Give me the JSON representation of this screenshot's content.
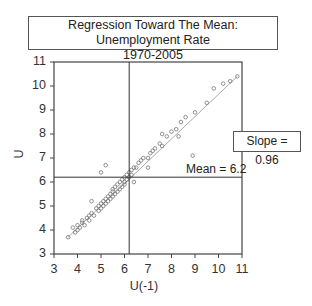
{
  "title": {
    "line1": "Regression Toward The Mean: Unemployment Rate",
    "line2": "1970-2005"
  },
  "annotations": {
    "slope": "Slope = 0.96",
    "mean": "Mean = 6.2"
  },
  "axes": {
    "xlabel": "U(-1)",
    "ylabel": "U",
    "x_ticks": [
      "3",
      "4",
      "5",
      "6",
      "7",
      "8",
      "9",
      "10",
      "11"
    ],
    "y_ticks": [
      "3",
      "4",
      "5",
      "6",
      "7",
      "8",
      "9",
      "10",
      "11"
    ]
  },
  "colors": {
    "frame": "#444444",
    "points": "#777777",
    "regression_line": "#aaaaaa",
    "mean_lines": "#333333"
  },
  "chart_data": {
    "type": "scatter",
    "title": "Regression Toward The Mean: Unemployment Rate 1970-2005",
    "xlabel": "U(-1)",
    "ylabel": "U",
    "xlim": [
      3,
      11
    ],
    "ylim": [
      3,
      11
    ],
    "grid": false,
    "mean": 6.2,
    "slope": 0.96,
    "regression_line": {
      "x": [
        3.6,
        10.8
      ],
      "y": [
        3.7,
        10.4
      ]
    },
    "series": [
      {
        "name": "U vs U(-1)",
        "x": [
          3.6,
          3.8,
          3.9,
          4.0,
          4.0,
          4.1,
          4.2,
          4.2,
          4.3,
          4.4,
          4.5,
          4.5,
          4.6,
          4.7,
          4.8,
          4.9,
          4.9,
          5.0,
          5.0,
          5.1,
          5.1,
          5.2,
          5.2,
          5.3,
          5.3,
          5.4,
          5.4,
          5.5,
          5.5,
          5.5,
          5.6,
          5.6,
          5.7,
          5.7,
          5.8,
          5.8,
          5.9,
          5.9,
          6.0,
          6.0,
          6.0,
          6.1,
          6.1,
          6.2,
          6.2,
          6.3,
          6.3,
          6.4,
          6.5,
          6.6,
          6.7,
          6.8,
          7.0,
          7.1,
          7.2,
          7.3,
          7.5,
          7.6,
          7.8,
          8.0,
          8.2,
          8.4,
          8.6,
          9.0,
          9.5,
          9.8,
          10.2,
          10.5,
          10.8,
          5.2,
          5.0,
          4.6,
          6.4,
          7.0,
          7.6,
          8.3,
          8.9
        ],
        "y": [
          3.7,
          4.1,
          3.9,
          4.2,
          4.0,
          4.1,
          4.3,
          4.4,
          4.2,
          4.5,
          4.6,
          4.4,
          4.7,
          4.6,
          4.9,
          4.8,
          5.0,
          5.1,
          4.9,
          5.0,
          5.2,
          5.3,
          5.1,
          5.4,
          5.2,
          5.5,
          5.3,
          5.6,
          5.4,
          5.7,
          5.5,
          5.8,
          5.6,
          5.9,
          5.7,
          6.0,
          5.8,
          6.1,
          5.9,
          6.2,
          6.0,
          6.1,
          6.3,
          6.2,
          6.4,
          6.3,
          6.5,
          6.6,
          6.6,
          6.8,
          6.9,
          7.0,
          7.0,
          7.2,
          7.3,
          7.4,
          7.6,
          7.5,
          7.9,
          8.1,
          8.2,
          8.5,
          8.7,
          8.9,
          9.3,
          9.9,
          10.1,
          10.2,
          10.4,
          6.7,
          6.4,
          5.2,
          6.0,
          6.6,
          8.0,
          7.9,
          7.1
        ]
      }
    ]
  }
}
